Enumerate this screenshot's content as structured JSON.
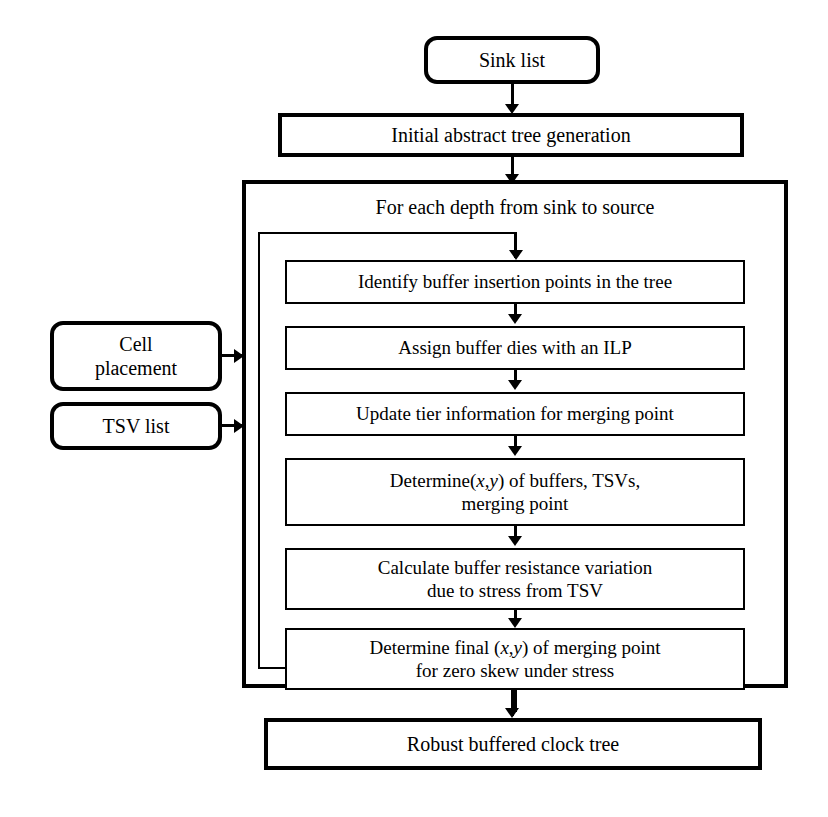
{
  "diagram": {
    "ink_color": "#000000",
    "background_color": "#ffffff"
  },
  "nodes": {
    "sink_list": {
      "label": "Sink list",
      "shape": "rounded-terminal"
    },
    "initial_tree": {
      "label": "Initial abstract tree generation",
      "shape": "rectangle"
    },
    "loop_label": {
      "label": "For each depth from sink to source",
      "shape": "loop-container-label"
    },
    "cell_placement": {
      "label": "Cell\nplacement",
      "shape": "rounded-terminal"
    },
    "tsv_list": {
      "label": "TSV list",
      "shape": "rounded-terminal"
    },
    "output": {
      "label": "Robust buffered clock tree",
      "shape": "rectangle"
    }
  },
  "steps": [
    {
      "id": "identify-buffer-insertion-points",
      "line1": "Identify buffer insertion points in the tree",
      "line2": ""
    },
    {
      "id": "assign-buffer-dies-ilp",
      "line1": "Assign buffer dies with an ILP",
      "line2": ""
    },
    {
      "id": "update-tier-information",
      "line1": "Update tier information for merging point",
      "line2": ""
    },
    {
      "id": "determine-xy-buffers-tsvs",
      "line1": "Determine(x,y) of buffers, TSVs,",
      "line2": "merging point"
    },
    {
      "id": "calculate-buffer-resistance-variation",
      "line1": "Calculate buffer resistance variation",
      "line2": "due to stress from TSV"
    },
    {
      "id": "determine-final-xy-merging-point",
      "line1": "Determine final (x,y) of merging point",
      "line2": "for zero skew under stress"
    }
  ],
  "connectors": {
    "sink_to_initial": "arrow-down",
    "initial_to_loop": "arrow-down",
    "loop_entry": "arrow-down",
    "step_chain": "arrow-down",
    "loop_back": "feedback-path",
    "cell_placement_to_loop": "arrow-right",
    "tsv_list_to_loop": "arrow-right",
    "loop_to_output": "arrow-down"
  }
}
